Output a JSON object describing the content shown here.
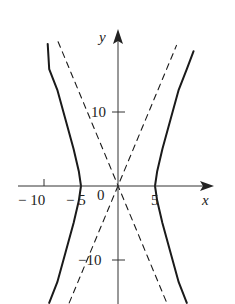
{
  "chart_data": {
    "type": "line",
    "title": "",
    "xlabel": "x",
    "ylabel": "y",
    "xlim": [
      -14.6,
      12.8
    ],
    "ylim": [
      -15.8,
      21
    ],
    "grid": false,
    "legend": null,
    "x_ticks": [
      {
        "value": -10,
        "label": "− 10"
      },
      {
        "value": -5,
        "label": "− 5"
      },
      {
        "value": 5,
        "label": "5"
      }
    ],
    "y_ticks": [
      {
        "value": 10,
        "label": "10"
      },
      {
        "value": -10,
        "label": "−10"
      }
    ],
    "origin_label": "0",
    "series": [
      {
        "name": "hyperbola right branch",
        "style": "solid",
        "equation": "x^2/25 - y^2/144 = 1",
        "points": [
          [
            9.3,
            -15.8
          ],
          [
            8.2,
            -13
          ],
          [
            7.1,
            -9
          ],
          [
            6.0,
            -5
          ],
          [
            5.3,
            -2
          ],
          [
            5,
            0
          ],
          [
            5.3,
            2
          ],
          [
            6.0,
            5
          ],
          [
            7.1,
            9
          ],
          [
            8.2,
            13
          ],
          [
            9.3,
            15.8
          ],
          [
            10.2,
            18.2
          ]
        ]
      },
      {
        "name": "hyperbola left branch",
        "style": "solid",
        "equation": "x^2/25 - y^2/144 = 1",
        "points": [
          [
            -9.3,
            -15.8
          ],
          [
            -8.2,
            -13
          ],
          [
            -7.1,
            -9
          ],
          [
            -6.0,
            -5
          ],
          [
            -5.3,
            -2
          ],
          [
            -5,
            0
          ],
          [
            -5.3,
            2
          ],
          [
            -6.0,
            5
          ],
          [
            -7.1,
            9
          ],
          [
            -8.2,
            13
          ],
          [
            -9.3,
            15.8
          ],
          [
            -9.5,
            19.2
          ]
        ]
      },
      {
        "name": "asymptote y = 12x/5",
        "style": "dashed",
        "points": [
          [
            -6.6,
            -15.8
          ],
          [
            7.9,
            19
          ]
        ]
      },
      {
        "name": "asymptote y = -12x/5",
        "style": "dashed",
        "points": [
          [
            -8.1,
            19.5
          ],
          [
            6.6,
            -15.8
          ]
        ]
      }
    ]
  },
  "axes": {
    "x_label": "x",
    "y_label": "y"
  },
  "labels": {
    "x_neg10": "− 10",
    "x_neg5": "− 5",
    "x_5": "5",
    "y_10": "10",
    "y_neg10": "−10",
    "origin": "0"
  }
}
